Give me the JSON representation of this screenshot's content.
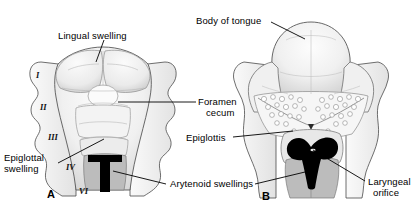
{
  "figure": {
    "kind": "anatomical-illustration",
    "panels": [
      {
        "id": "A",
        "label": "A",
        "caption": "Early embryonic tongue with pharyngeal arch swellings"
      },
      {
        "id": "B",
        "label": "B",
        "caption": "Mature tongue with papillae and laryngeal orifice"
      }
    ]
  },
  "labels": {
    "lingual_swelling": "Lingual swelling",
    "body_of_tongue": "Body of tongue",
    "foramen_cecum_line1": "Foramen",
    "foramen_cecum_line2": "cecum",
    "epiglottal_swelling_line1": "Epiglottal",
    "epiglottal_swelling_line2": "swelling",
    "epiglottis": "Epiglottis",
    "arytenoid_swellings": "Arytenoid swellings",
    "laryngeal_orifice_line1": "Laryngeal",
    "laryngeal_orifice_line2": "orifice"
  },
  "arch_numerals": {
    "one": "I",
    "two": "II",
    "three": "III",
    "four": "IV",
    "six": "VI"
  },
  "colors": {
    "background": "#ffffff",
    "ink": "#000000",
    "outline": "#3a3a3a",
    "tissue_light": "#f4f4f4",
    "tissue_mid": "#d9d9d9",
    "tissue_shade": "#b9b9b9",
    "orifice_black": "#000000",
    "leader": "#000000"
  }
}
